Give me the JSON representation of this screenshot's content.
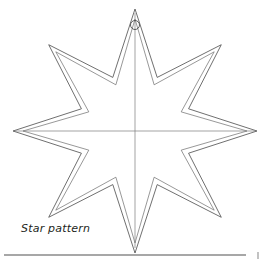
{
  "document": {
    "figure_title": "Star pattern",
    "figure_kind": "craft-template-diagram"
  },
  "caption": {
    "label": "Star pattern"
  },
  "colors": {
    "background": "#ffffff",
    "outline_stroke": "#4a4a4a",
    "inner_outline_stroke": "#6b6b6b",
    "construction_line": "#7d7d7d",
    "hole_stroke": "#4a4a4a",
    "rule": "#8a8a8a",
    "caption_text": "#231f20"
  },
  "geometry": {
    "center": {
      "x": 135,
      "y": 131
    },
    "points": 8,
    "outer_star": {
      "outer_radius": 122,
      "inner_radius": 58,
      "rotation_deg": -90,
      "tips": [
        {
          "name": "top",
          "x": 135,
          "y": 13
        },
        {
          "name": "upper-right",
          "x": 218,
          "y": 48
        },
        {
          "name": "right",
          "x": 255,
          "y": 131
        },
        {
          "name": "lower-right",
          "x": 218,
          "y": 214
        },
        {
          "name": "bottom",
          "x": 135,
          "y": 248
        },
        {
          "name": "lower-left",
          "x": 50,
          "y": 214
        },
        {
          "name": "left",
          "x": 15,
          "y": 131
        },
        {
          "name": "upper-left",
          "x": 50,
          "y": 48
        }
      ]
    },
    "inner_star": {
      "outer_radius": 112,
      "inner_radius": 50,
      "rotation_deg": -90
    },
    "hanging_hole": {
      "cx": 135,
      "cy": 25,
      "r": 4.5
    },
    "construction_lines": [
      {
        "name": "vertical-axis",
        "x1": 135,
        "y1": 13,
        "x2": 135,
        "y2": 248
      },
      {
        "name": "horizontal-axis",
        "x1": 15,
        "y1": 131,
        "x2": 255,
        "y2": 131
      }
    ]
  },
  "footer_rule": {
    "x1": 4,
    "y1": 255,
    "x2": 246,
    "y2": 255,
    "tick": {
      "x": 258,
      "y1": 252,
      "y2": 259
    }
  }
}
